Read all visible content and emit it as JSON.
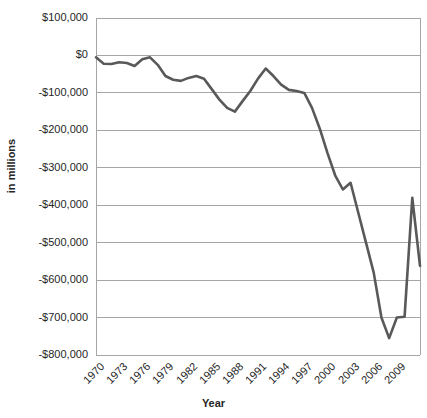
{
  "chart_data": {
    "type": "line",
    "title": "",
    "xlabel": "Year",
    "ylabel": "in millions",
    "xlim": [
      1970,
      2010
    ],
    "ylim": [
      -800000,
      100000
    ],
    "grid": true,
    "legend": false,
    "legend_position": "none",
    "line_color": "#595959",
    "x_tick_labels": [
      "1970",
      "1973",
      "1976",
      "1979",
      "1982",
      "1985",
      "1988",
      "1991",
      "1994",
      "1997",
      "2000",
      "2003",
      "2006",
      "2009"
    ],
    "x_tick_values": [
      1970,
      1973,
      1976,
      1979,
      1982,
      1985,
      1988,
      1991,
      1994,
      1997,
      2000,
      2003,
      2006,
      2009
    ],
    "y_tick_labels": [
      "$100,000",
      "$0",
      "-$100,000",
      "-$200,000",
      "-$300,000",
      "-$400,000",
      "-$500,000",
      "-$600,000",
      "-$700,000",
      "-$800,000"
    ],
    "y_tick_values": [
      100000,
      0,
      -100000,
      -200000,
      -300000,
      -400000,
      -500000,
      -600000,
      -700000,
      -800000
    ],
    "x": [
      1970,
      1971,
      1972,
      1973,
      1974,
      1975,
      1976,
      1977,
      1978,
      1979,
      1980,
      1981,
      1982,
      1983,
      1984,
      1985,
      1986,
      1987,
      1988,
      1989,
      1990,
      1991,
      1992,
      1993,
      1994,
      1995,
      1996,
      1997,
      1998,
      1999,
      2000,
      2001,
      2002,
      2003,
      2004,
      2005,
      2006,
      2007,
      2008,
      2009,
      2010
    ],
    "values": [
      -2800,
      -23000,
      -23400,
      -14900,
      -6100,
      -53200,
      -73700,
      -53700,
      -59200,
      -40700,
      -73800,
      -79000,
      -128000,
      -207800,
      -185400,
      -212300,
      -221200,
      -149700,
      -155200,
      -152600,
      -221100,
      -269200,
      -290400,
      -255100,
      -203200,
      -164000,
      -107500,
      -21900,
      69300,
      125600,
      236200,
      128200,
      -157800,
      -377600,
      -412700,
      -318300,
      -248200,
      -160700,
      -458600,
      -1412700,
      -1294400
    ],
    "series": [
      {
        "name": "Deficit",
        "points": [
          {
            "year": 1970,
            "value": -5000
          },
          {
            "year": 1971,
            "value": -22000
          },
          {
            "year": 1972,
            "value": -23000
          },
          {
            "year": 1973,
            "value": -18000
          },
          {
            "year": 1974,
            "value": -20000
          },
          {
            "year": 1975,
            "value": -28000
          },
          {
            "year": 1976,
            "value": -10000
          },
          {
            "year": 1977,
            "value": -5000
          },
          {
            "year": 1978,
            "value": -25000
          },
          {
            "year": 1979,
            "value": -55000
          },
          {
            "year": 1980,
            "value": -65000
          },
          {
            "year": 1981,
            "value": -68000
          },
          {
            "year": 1982,
            "value": -60000
          },
          {
            "year": 1983,
            "value": -55000
          },
          {
            "year": 1984,
            "value": -62000
          },
          {
            "year": 1985,
            "value": -90000
          },
          {
            "year": 1986,
            "value": -118000
          },
          {
            "year": 1987,
            "value": -140000
          },
          {
            "year": 1988,
            "value": -150000
          },
          {
            "year": 1989,
            "value": -122000
          },
          {
            "year": 1990,
            "value": -95000
          },
          {
            "year": 1991,
            "value": -62000
          },
          {
            "year": 1992,
            "value": -35000
          },
          {
            "year": 1993,
            "value": -55000
          },
          {
            "year": 1994,
            "value": -78000
          },
          {
            "year": 1995,
            "value": -92000
          },
          {
            "year": 1996,
            "value": -95000
          },
          {
            "year": 1997,
            "value": -100000
          },
          {
            "year": 1998,
            "value": -140000
          },
          {
            "year": 1999,
            "value": -195000
          },
          {
            "year": 2000,
            "value": -260000
          },
          {
            "year": 2001,
            "value": -320000
          },
          {
            "year": 2002,
            "value": -358000
          },
          {
            "year": 2003,
            "value": -340000
          },
          {
            "year": 2004,
            "value": -420000
          },
          {
            "year": 2005,
            "value": -500000
          },
          {
            "year": 2006,
            "value": -580000
          },
          {
            "year": 2007,
            "value": -700000
          },
          {
            "year": 2008,
            "value": -755000
          },
          {
            "year": 2009,
            "value": -700000
          },
          {
            "year": 2010,
            "value": -698000
          },
          {
            "year": 2011,
            "value": -380000
          },
          {
            "year": 2012,
            "value": -562000
          }
        ]
      }
    ]
  }
}
